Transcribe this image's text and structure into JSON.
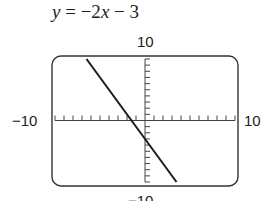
{
  "title": {
    "lhs": "y",
    "equals": " = ",
    "rhs_prefix": "−2",
    "rhs_var": "x",
    "rhs_suffix": " − 3"
  },
  "window": {
    "ymax_label": "10",
    "ymin_label": "−10",
    "xmin_label": "−10",
    "xmax_label": "10"
  },
  "chart_data": {
    "type": "line",
    "title": "y = −2x − 3",
    "xlabel": "",
    "ylabel": "",
    "xlim": [
      -10,
      10
    ],
    "ylim": [
      -10,
      10
    ],
    "x_tick_step": 1,
    "y_tick_step": 1,
    "grid": false,
    "series": [
      {
        "name": "y = -2x - 3",
        "slope": -2,
        "intercept": -3,
        "x": [
          -6.5,
          3.5
        ],
        "y": [
          10,
          -10
        ]
      }
    ],
    "annotations": [
      "10",
      "−10",
      "−10",
      "10"
    ]
  }
}
